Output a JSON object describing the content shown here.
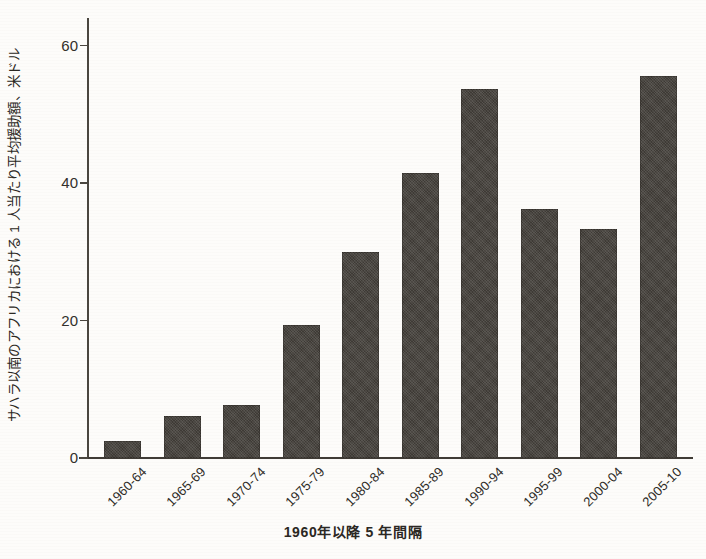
{
  "chart_data": {
    "type": "bar",
    "title": "",
    "subtitle": "",
    "xlabel": "1960年以降 5 年間隔",
    "ylabel": "サハラ以南のアフリカにおける 1 人当たり平均援助額、米ドル",
    "categories": [
      "1960-64",
      "1965-69",
      "1970-74",
      "1975-79",
      "1980-84",
      "1985-89",
      "1990-94",
      "1995-99",
      "2000-04",
      "2005-10"
    ],
    "values": [
      2.5,
      6.2,
      7.8,
      19.6,
      30.4,
      42.1,
      54.6,
      36.8,
      33.9,
      56.4
    ],
    "series": [
      {
        "name": "サハラ以南のアフリカにおける 1 人当たり平均援助額",
        "values": [
          2.5,
          6.2,
          7.8,
          19.6,
          30.4,
          42.1,
          54.6,
          36.8,
          33.9,
          56.4
        ]
      }
    ],
    "ylim": [
      0,
      64
    ],
    "yticks": [
      0,
      20,
      40,
      60
    ],
    "ytick_labels": [
      "0",
      "20",
      "40",
      "60"
    ],
    "grid": false,
    "legend": false,
    "legend_position": "none",
    "bar_color": "#3e3a35",
    "axis_color": "#3f3b35",
    "background_color": "#fdfcfa"
  },
  "axes": {
    "y_title": "サハラ以南のアフリカにおける 1 人当たり平均援助額、米ドル",
    "x_title": "1960年以降 5 年間隔"
  }
}
